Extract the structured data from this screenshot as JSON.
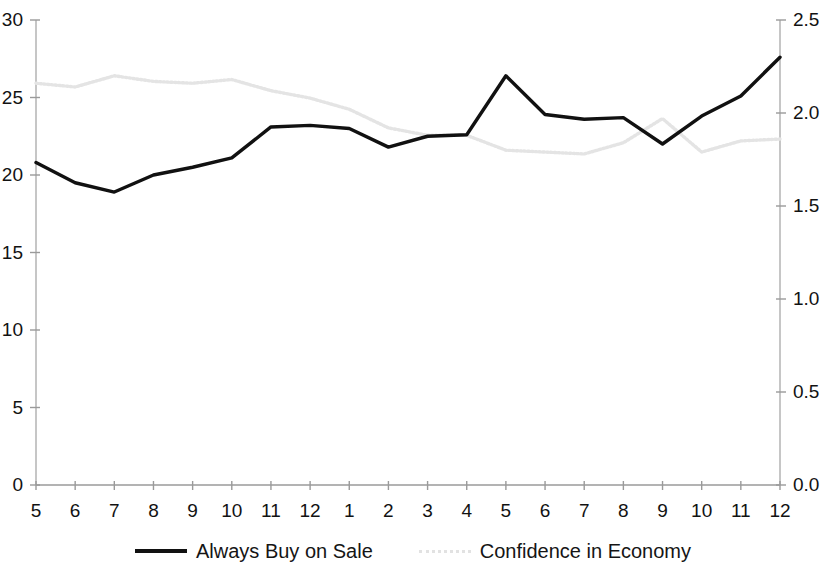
{
  "chart_data": {
    "type": "line",
    "title": "",
    "xlabel": "",
    "ylabel": "",
    "grid": false,
    "legend_position": "bottom",
    "categories": [
      "5",
      "6",
      "7",
      "8",
      "9",
      "10",
      "11",
      "12",
      "1",
      "2",
      "3",
      "4",
      "5",
      "6",
      "7",
      "8",
      "9",
      "10",
      "11",
      "12"
    ],
    "axes": {
      "left": {
        "label": "",
        "ylim": [
          0,
          30
        ],
        "ticks": [
          0,
          5,
          10,
          15,
          20,
          25,
          30
        ],
        "tick_labels": [
          "0",
          "5",
          "10",
          "15",
          "20",
          "25",
          "30"
        ]
      },
      "right": {
        "label": "",
        "ylim": [
          0.0,
          2.5
        ],
        "ticks": [
          0.0,
          0.5,
          1.0,
          1.5,
          2.0,
          2.5
        ],
        "tick_labels": [
          "0.0",
          "0.5",
          "1.0",
          "1.5",
          "2.0",
          "2.5"
        ]
      }
    },
    "series": [
      {
        "name": "Always Buy on Sale",
        "axis": "left",
        "color": "#111111",
        "style": "solid",
        "values": [
          20.8,
          19.5,
          18.9,
          20.0,
          20.5,
          21.1,
          23.1,
          23.2,
          23.0,
          21.8,
          22.5,
          22.6,
          26.4,
          23.9,
          23.6,
          23.7,
          22.0,
          23.8,
          25.1,
          27.6
        ]
      },
      {
        "name": "Confidence in Economy",
        "axis": "right",
        "color": "#e4e4e4",
        "style": "dotted",
        "values": [
          2.16,
          2.14,
          2.2,
          2.17,
          2.16,
          2.18,
          2.12,
          2.08,
          2.02,
          1.92,
          1.88,
          1.88,
          1.8,
          1.79,
          1.78,
          1.84,
          1.97,
          1.79,
          1.85,
          1.86
        ]
      }
    ]
  },
  "legend": {
    "items": [
      {
        "label": "Always Buy on Sale",
        "marker": "solid-line-swatch"
      },
      {
        "label": "Confidence in Economy",
        "marker": "dotted-line-swatch"
      }
    ]
  }
}
